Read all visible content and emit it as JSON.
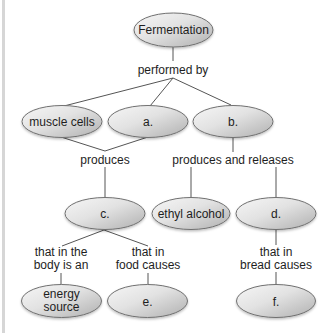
{
  "diagram": {
    "type": "concept-map",
    "nodes": {
      "fermentation": "Fermentation",
      "muscle_cells": "muscle cells",
      "a": "a.",
      "b": "b.",
      "c": "c.",
      "ethyl_alcohol": "ethyl alcohol",
      "d": "d.",
      "energy_source_line1": "energy",
      "energy_source_line2": "source",
      "e": "e.",
      "f": "f."
    },
    "links": {
      "performed_by": "performed by",
      "produces": "produces",
      "produces_and_releases": "produces and releases",
      "body_line1": "that in the",
      "body_line2": "body is an",
      "food_line1": "that in",
      "food_line2": "food causes",
      "bread_line1": "that in",
      "bread_line2": "bread causes"
    },
    "colors": {
      "node_light": "#f4f4f4",
      "node_dark": "#b4b4b4",
      "node_border": "#707070",
      "line": "#555555",
      "text": "#1e1e1e"
    }
  }
}
